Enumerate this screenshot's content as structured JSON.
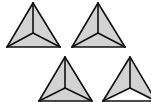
{
  "diagram": {
    "type": "tetrahedra-views",
    "colors": {
      "fill": "#d3d3d3",
      "stroke": "#111111",
      "background": "#ffffff",
      "unshaded": "#ffffff"
    },
    "tetrahedra": [
      {
        "id": 1,
        "apex": [
          33,
          3
        ],
        "center": [
          33,
          33
        ],
        "left": [
          7,
          47
        ],
        "right": [
          60,
          47
        ],
        "shaded_faces": [
          "left",
          "right",
          "bottom"
        ]
      },
      {
        "id": 2,
        "apex": [
          98,
          3
        ],
        "center": [
          98,
          33
        ],
        "left": [
          72,
          47
        ],
        "right": [
          125,
          47
        ],
        "shaded_faces": [
          "left",
          "right",
          "bottom"
        ]
      },
      {
        "id": 3,
        "apex": [
          65,
          57
        ],
        "center": [
          65,
          88
        ],
        "left": [
          39,
          101
        ],
        "right": [
          92,
          101
        ],
        "shaded_faces": [
          "left",
          "right",
          "bottom"
        ]
      },
      {
        "id": 4,
        "apex": [
          130,
          57
        ],
        "center": [
          130,
          88
        ],
        "left": [
          103,
          101
        ],
        "right": [
          156,
          101
        ],
        "shaded_faces": [
          "left",
          "right"
        ]
      }
    ]
  }
}
